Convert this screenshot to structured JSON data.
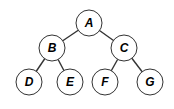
{
  "diagram": {
    "type": "binary-tree",
    "node_radius": 13,
    "nodes": [
      {
        "id": "A",
        "label": "A",
        "x": 89,
        "y": 23
      },
      {
        "id": "B",
        "label": "B",
        "x": 52,
        "y": 48
      },
      {
        "id": "C",
        "label": "C",
        "x": 124,
        "y": 48
      },
      {
        "id": "D",
        "label": "D",
        "x": 29,
        "y": 82
      },
      {
        "id": "E",
        "label": "E",
        "x": 70,
        "y": 82
      },
      {
        "id": "F",
        "label": "F",
        "x": 105,
        "y": 82
      },
      {
        "id": "G",
        "label": "G",
        "x": 150,
        "y": 82
      }
    ],
    "edges": [
      {
        "from": "A",
        "to": "B"
      },
      {
        "from": "A",
        "to": "C"
      },
      {
        "from": "B",
        "to": "D"
      },
      {
        "from": "B",
        "to": "E"
      },
      {
        "from": "C",
        "to": "F"
      },
      {
        "from": "C",
        "to": "G"
      }
    ],
    "colors": {
      "node_fill": "#ffffff",
      "node_stroke": "#333333",
      "edge": "#333333",
      "label": "#000000"
    }
  }
}
